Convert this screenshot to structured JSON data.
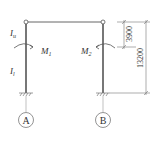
{
  "diagram": {
    "type": "portal-frame",
    "colors": {
      "line": "#555555",
      "column": "#777777",
      "text": "#333333",
      "background": "#ffffff"
    },
    "columns": [
      {
        "id": "A",
        "axis_label": "A",
        "moment_label": "M",
        "moment_sub": "1",
        "upper_inertia": "I",
        "upper_inertia_sub": "u",
        "lower_inertia": "I",
        "lower_inertia_sub": "l"
      },
      {
        "id": "B",
        "axis_label": "B",
        "moment_label": "M",
        "moment_sub": "2"
      }
    ],
    "dimensions": {
      "upper": "3900",
      "total": "13200"
    }
  }
}
